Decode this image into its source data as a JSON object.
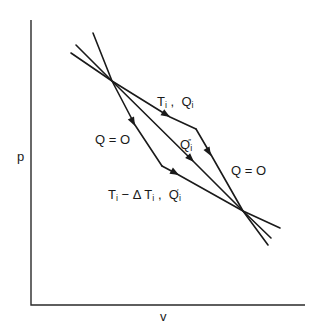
{
  "figure": {
    "axes": {
      "y_label": "p",
      "x_label": "v"
    },
    "labels": {
      "upper_isotherm": {
        "t": "T",
        "t_sub": "i",
        "sep": " ,  ",
        "q": "Q",
        "q_sub": "i"
      },
      "left_adiabat": "Q = O",
      "right_adiabat": "Q = O",
      "middle_path": {
        "q": "Q",
        "q_sub": "i",
        "q_sup": "″"
      },
      "lower_isotherm": {
        "t": "T",
        "t_sub": "i",
        "minus": " − Δ ",
        "t2": "T",
        "t2_sub": "i",
        "sep": " ,  ",
        "q": "Q",
        "q_sub": "i",
        "q_sup": "′"
      }
    },
    "geometry": {
      "upper_intersection": [
        112,
        81
      ],
      "lower_intersection": [
        243,
        211
      ],
      "upper_corner": [
        196,
        129
      ],
      "lower_corner": [
        162,
        166
      ]
    },
    "colors": {
      "line": "#1a1a1a",
      "background": "#ffffff"
    }
  }
}
